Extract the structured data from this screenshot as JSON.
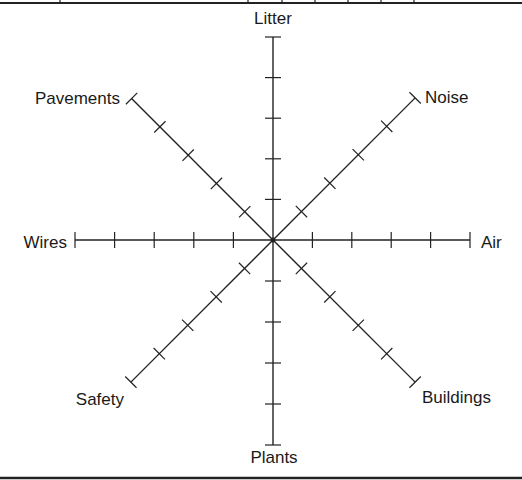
{
  "diagram": {
    "type": "radar-axes",
    "center": [
      273,
      240
    ],
    "tick_count": 5,
    "line_color": "#222222",
    "axes": [
      {
        "label": "Litter",
        "angle": 90,
        "radius": 203,
        "label_pos": [
          273,
          24
        ],
        "anchor": "middle"
      },
      {
        "label": "Noise",
        "angle": 45,
        "radius": 201,
        "label_pos": [
          425,
          103
        ],
        "anchor": "start"
      },
      {
        "label": "Air",
        "angle": 0,
        "radius": 197,
        "label_pos": [
          481,
          248
        ],
        "anchor": "start"
      },
      {
        "label": "Buildings",
        "angle": -45,
        "radius": 201,
        "label_pos": [
          422,
          403
        ],
        "anchor": "start"
      },
      {
        "label": "Plants",
        "angle": -90,
        "radius": 205,
        "label_pos": [
          274,
          463
        ],
        "anchor": "middle"
      },
      {
        "label": "Safety",
        "angle": -135,
        "radius": 201,
        "label_pos": [
          124,
          405
        ],
        "anchor": "end"
      },
      {
        "label": "Wires",
        "angle": 180,
        "radius": 198,
        "label_pos": [
          67,
          248
        ],
        "anchor": "end"
      },
      {
        "label": "Pavements",
        "angle": 135,
        "radius": 200,
        "label_pos": [
          120,
          104
        ],
        "anchor": "end"
      }
    ]
  },
  "frame": {
    "top_rule_y": 3,
    "top_dividers_x": [
      60,
      248,
      282,
      315,
      348,
      381,
      414
    ],
    "bottom_rule_y": 478
  }
}
